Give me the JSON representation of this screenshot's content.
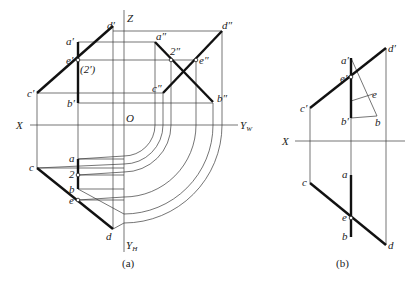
{
  "figure_a": {
    "caption": "(a)",
    "axes": {
      "z": "Z",
      "x": "X",
      "origin": "O",
      "yw": "Y",
      "yw_sub": "W",
      "yh": "Y",
      "yh_sub": "H"
    },
    "front_view": {
      "a": "a′",
      "b": "b′",
      "c": "c′",
      "d": "d′",
      "e": "e′",
      "hidden_2": "(2′)"
    },
    "side_view": {
      "a": "a″",
      "b": "b″",
      "c": "c″",
      "d": "d″",
      "e": "e″",
      "two": "2″"
    },
    "top_view": {
      "a": "a",
      "b": "b",
      "c": "c",
      "d": "d",
      "e": "e",
      "two": "2"
    }
  },
  "figure_b": {
    "caption": "(b)",
    "axes": {
      "x": "X"
    },
    "front_view": {
      "a": "a′",
      "b": "b′",
      "c": "c′",
      "d": "d′",
      "e": "e′"
    },
    "construction": {
      "e": "e",
      "b": "b"
    },
    "top_view": {
      "a": "a",
      "b": "b",
      "c": "c",
      "d": "d",
      "e": "e"
    }
  }
}
